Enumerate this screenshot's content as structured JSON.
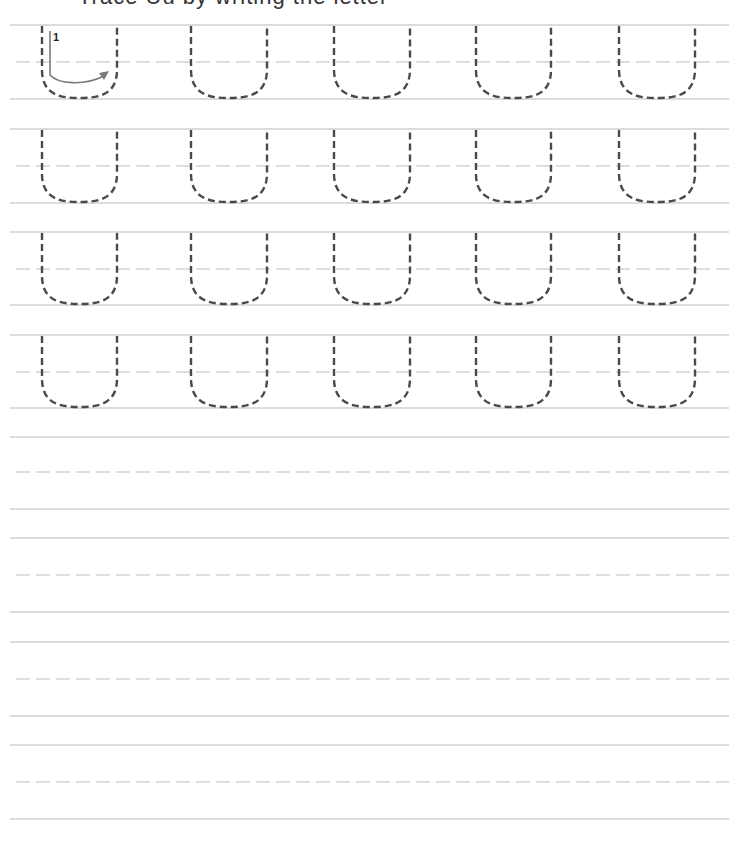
{
  "worksheet": {
    "title_clipped": "Trace Uu by writing the letter",
    "letter": "U",
    "stroke_number": "1",
    "letters_per_row": 5,
    "traced_rows": 4,
    "blank_rows": 4,
    "colors": {
      "solid_line": "#b9b9b9",
      "guide_line": "#bdbdbd",
      "letter_dash": "#4a4a4a",
      "arrow": "#7a7a7a",
      "background": "#ffffff"
    },
    "rows": [
      {
        "top": 25,
        "mid": 62,
        "bottom": 99,
        "traced": true
      },
      {
        "top": 129,
        "mid": 166,
        "bottom": 203,
        "traced": true
      },
      {
        "top": 232,
        "mid": 269,
        "bottom": 305,
        "traced": true
      },
      {
        "top": 335,
        "mid": 372,
        "bottom": 408,
        "traced": true
      },
      {
        "top": 437,
        "mid": 472,
        "bottom": 509,
        "traced": false
      },
      {
        "top": 538,
        "mid": 575,
        "bottom": 612,
        "traced": false
      },
      {
        "top": 642,
        "mid": 679,
        "bottom": 716,
        "traced": false
      },
      {
        "top": 745,
        "mid": 782,
        "bottom": 819,
        "traced": false
      }
    ],
    "letter_x": [
      {
        "left": 42,
        "right": 117
      },
      {
        "left": 191,
        "right": 267
      },
      {
        "left": 334,
        "right": 410
      },
      {
        "left": 476,
        "right": 551
      },
      {
        "left": 619,
        "right": 695
      }
    ],
    "line_x_start": 10,
    "guide_x_start": 16,
    "line_x_end": 729
  }
}
